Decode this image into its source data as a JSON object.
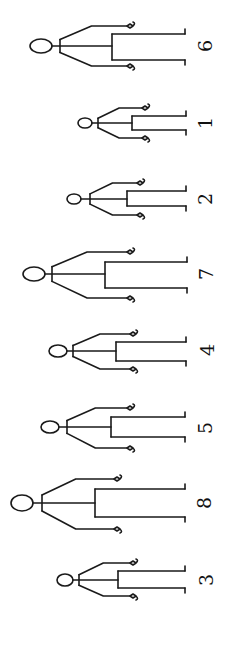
{
  "diagram": {
    "stroke_color": "#1a1a1a",
    "background": "#ffffff",
    "figures": [
      {
        "label": "6",
        "head": {
          "cx": 41,
          "cy": 46,
          "rx": 11,
          "ry": 7
        },
        "shoulder_x": 60,
        "hip_x": 112,
        "foot_x": 185,
        "leg_y": [
          34,
          60
        ],
        "hand_x": 130,
        "hand_y": [
          26,
          66
        ],
        "label_pos": {
          "x": 205,
          "y": 46
        }
      },
      {
        "label": "1",
        "head": {
          "cx": 85,
          "cy": 123,
          "rx": 7,
          "ry": 5
        },
        "shoulder_x": 98,
        "hip_x": 132,
        "foot_x": 186,
        "leg_y": [
          116,
          130
        ],
        "hand_x": 145,
        "hand_y": [
          108,
          138
        ],
        "label_pos": {
          "x": 205,
          "y": 123
        }
      },
      {
        "label": "2",
        "head": {
          "cx": 74,
          "cy": 199,
          "rx": 7,
          "ry": 5
        },
        "shoulder_x": 90,
        "hip_x": 127,
        "foot_x": 186,
        "leg_y": [
          191,
          206
        ],
        "hand_x": 140,
        "hand_y": [
          183,
          215
        ],
        "label_pos": {
          "x": 205,
          "y": 199
        }
      },
      {
        "label": "7",
        "head": {
          "cx": 34,
          "cy": 274,
          "rx": 11,
          "ry": 7
        },
        "shoulder_x": 52,
        "hip_x": 105,
        "foot_x": 187,
        "leg_y": [
          262,
          288
        ],
        "hand_x": 130,
        "hand_y": [
          252,
          298
        ],
        "label_pos": {
          "x": 206,
          "y": 274
        }
      },
      {
        "label": "4",
        "head": {
          "cx": 58,
          "cy": 351,
          "rx": 9,
          "ry": 6
        },
        "shoulder_x": 73,
        "hip_x": 116,
        "foot_x": 186,
        "leg_y": [
          342,
          361
        ],
        "hand_x": 133,
        "hand_y": [
          334,
          369
        ],
        "label_pos": {
          "x": 207,
          "y": 350
        }
      },
      {
        "label": "5",
        "head": {
          "cx": 50,
          "cy": 427,
          "rx": 9,
          "ry": 6
        },
        "shoulder_x": 67,
        "hip_x": 111,
        "foot_x": 185,
        "leg_y": [
          417,
          437
        ],
        "hand_x": 130,
        "hand_y": [
          408,
          448
        ],
        "label_pos": {
          "x": 205,
          "y": 428
        }
      },
      {
        "label": "8",
        "head": {
          "cx": 22,
          "cy": 503,
          "rx": 11,
          "ry": 8
        },
        "shoulder_x": 42,
        "hip_x": 95,
        "foot_x": 185,
        "leg_y": [
          489,
          517
        ],
        "hand_x": 117,
        "hand_y": [
          479,
          529
        ],
        "label_pos": {
          "x": 204,
          "y": 503
        }
      },
      {
        "label": "3",
        "head": {
          "cx": 65,
          "cy": 580,
          "rx": 8,
          "ry": 6
        },
        "shoulder_x": 79,
        "hip_x": 118,
        "foot_x": 185,
        "leg_y": [
          571,
          588
        ],
        "hand_x": 133,
        "hand_y": [
          563,
          596
        ],
        "label_pos": {
          "x": 206,
          "y": 580
        }
      }
    ]
  }
}
